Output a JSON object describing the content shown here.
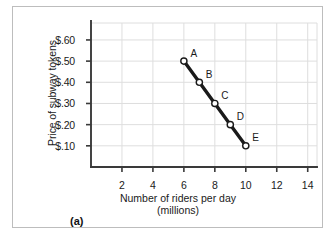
{
  "chart_data": {
    "type": "line",
    "title": "",
    "xlabel": "Number of riders per day",
    "xlabel_unit": "(millions)",
    "ylabel": "Price of subway tokens",
    "xlim": [
      0,
      14.6
    ],
    "ylim": [
      0,
      0.68
    ],
    "grid": true,
    "legend_position": "none",
    "x_ticks": [
      2,
      4,
      6,
      8,
      10,
      12,
      14
    ],
    "x_tick_labels": [
      "2",
      "4",
      "6",
      "8",
      "10",
      "12",
      "14"
    ],
    "y_ticks": [
      0.1,
      0.2,
      0.3,
      0.4,
      0.5,
      0.6
    ],
    "y_tick_labels": [
      "$.10",
      "$.20",
      "$.30",
      "$.40",
      "$.50",
      "$.60"
    ],
    "series": [
      {
        "name": "demand",
        "marker": "open-circle",
        "x": [
          6,
          7,
          8,
          9,
          10
        ],
        "y": [
          0.5,
          0.4,
          0.3,
          0.2,
          0.1
        ],
        "point_labels": [
          "A",
          "B",
          "C",
          "D",
          "E"
        ]
      }
    ],
    "points": [
      {
        "label": "A",
        "x": 6,
        "y": 0.5
      },
      {
        "label": "B",
        "x": 7,
        "y": 0.4
      },
      {
        "label": "C",
        "x": 8,
        "y": 0.3
      },
      {
        "label": "D",
        "x": 9,
        "y": 0.2
      },
      {
        "label": "E",
        "x": 10,
        "y": 0.1
      }
    ],
    "colors": {
      "line": "#1a1a1a",
      "marker_fill": "#ffffff",
      "marker_stroke": "#1a1a1a",
      "axis": "#3a3a3a",
      "grid": "#dedede",
      "frame": "#bdbdbd",
      "text": "#1a1a1a"
    }
  },
  "caption": {
    "panel_label": "(a)"
  }
}
